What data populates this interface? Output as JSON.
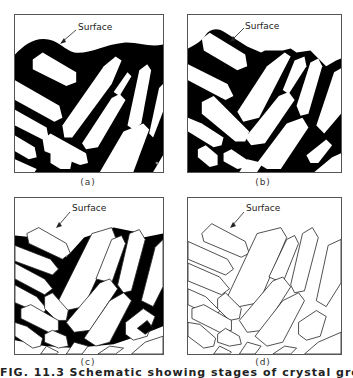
{
  "figure": {
    "panels": [
      {
        "id": "a",
        "caption": "(a)",
        "surface_label": "Surface"
      },
      {
        "id": "b",
        "caption": "(b)",
        "surface_label": "Surface"
      },
      {
        "id": "c",
        "caption": "(c)",
        "surface_label": "Surface"
      },
      {
        "id": "d",
        "caption": "(d)",
        "surface_label": "Surface"
      }
    ],
    "bottom_caption_fragment": "FIG. 11.3  Schematic showing stages of crystal growth and grain boundary formation",
    "colors": {
      "matrix": "#000000",
      "crystal": "#ffffff",
      "border": "#555555"
    }
  }
}
